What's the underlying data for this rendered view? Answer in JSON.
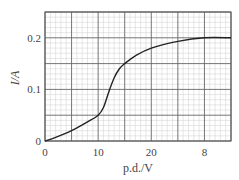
{
  "chart_data": {
    "type": "line",
    "title": "",
    "xlabel": "p.d./V",
    "ylabel": "I/A",
    "xlim": [
      0,
      35
    ],
    "ylim": [
      0,
      0.25
    ],
    "grid": true,
    "x_tick_labels": [
      "0",
      "10",
      "20",
      "8"
    ],
    "x_tick_values": [
      0,
      10,
      20,
      30
    ],
    "y_tick_labels": [
      "0",
      "0.1",
      "0.2"
    ],
    "y_tick_values": [
      0,
      0.1,
      0.2
    ],
    "series": [
      {
        "name": "I-V curve",
        "x": [
          0,
          2,
          5,
          8,
          10,
          11,
          12,
          13,
          14,
          15,
          17,
          20,
          25,
          30,
          35
        ],
        "y": [
          0,
          0.007,
          0.02,
          0.037,
          0.05,
          0.065,
          0.095,
          0.122,
          0.14,
          0.15,
          0.165,
          0.18,
          0.193,
          0.2,
          0.2
        ]
      }
    ]
  }
}
